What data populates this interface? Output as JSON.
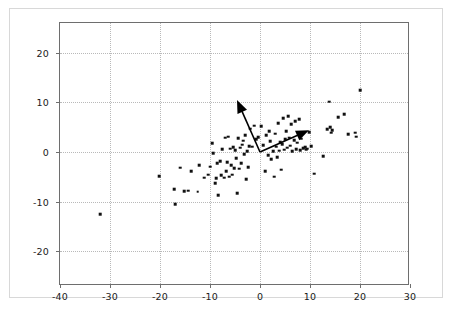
{
  "chart_data": {
    "type": "scatter",
    "title": "",
    "subtitle": "",
    "xlabel": "",
    "ylabel": "",
    "xlim": [
      -40,
      30
    ],
    "ylim": [
      -27,
      26
    ],
    "grid": true,
    "grid_style": "dotted",
    "legend": "none",
    "point_color": "#111111",
    "point_marker": "square",
    "point_size_px": 2.6,
    "xticks": [
      -40,
      -30,
      -20,
      -10,
      0,
      10,
      20,
      30
    ],
    "xtick_labels": [
      "-40",
      "-30",
      "-20",
      "-10",
      "0",
      "10",
      "20",
      "30"
    ],
    "yticks": [
      -20,
      -10,
      0,
      10,
      20
    ],
    "ytick_labels": [
      "-20",
      "-10",
      "0",
      "10",
      "20"
    ],
    "series": [
      {
        "name": "data",
        "points": [
          [
            -32.0,
            -12.5
          ],
          [
            -20.2,
            -4.9
          ],
          [
            -17.2,
            -7.5
          ],
          [
            -17.0,
            -10.5
          ],
          [
            -16.0,
            -3.2
          ],
          [
            -15.2,
            -7.9
          ],
          [
            -14.4,
            -7.8
          ],
          [
            -13.8,
            -3.9
          ],
          [
            -12.5,
            -8.0
          ],
          [
            -12.2,
            -2.6
          ],
          [
            -11.2,
            -5.2
          ],
          [
            -10.4,
            -4.6
          ],
          [
            -10.0,
            -3.0
          ],
          [
            -9.6,
            1.8
          ],
          [
            -9.4,
            -0.2
          ],
          [
            -9.0,
            -6.3
          ],
          [
            -8.8,
            -5.3
          ],
          [
            -8.6,
            -2.2
          ],
          [
            -8.4,
            -8.7
          ],
          [
            -8.0,
            -1.8
          ],
          [
            -7.8,
            -4.7
          ],
          [
            -7.6,
            0.6
          ],
          [
            -7.2,
            -5.2
          ],
          [
            -7.0,
            2.9
          ],
          [
            -6.8,
            -3.9
          ],
          [
            -6.6,
            -2.0
          ],
          [
            -6.4,
            3.1
          ],
          [
            -6.2,
            -5.0
          ],
          [
            -6.0,
            0.7
          ],
          [
            -5.8,
            -2.6
          ],
          [
            -5.6,
            -4.6
          ],
          [
            -5.4,
            1.0
          ],
          [
            -5.2,
            -3.3
          ],
          [
            -5.0,
            0.4
          ],
          [
            -4.8,
            -1.2
          ],
          [
            -4.6,
            -8.3
          ],
          [
            -4.4,
            2.8
          ],
          [
            -4.2,
            -3.4
          ],
          [
            -4.0,
            0.9
          ],
          [
            -3.8,
            -2.3
          ],
          [
            -3.6,
            1.5
          ],
          [
            -3.4,
            2.3
          ],
          [
            -3.2,
            -0.4
          ],
          [
            -3.0,
            3.4
          ],
          [
            -2.8,
            -5.5
          ],
          [
            -2.6,
            0.2
          ],
          [
            -2.4,
            -3.1
          ],
          [
            -2.2,
            1.2
          ],
          [
            -2.0,
            4.7
          ],
          [
            -1.6,
            1.1
          ],
          [
            -1.2,
            5.3
          ],
          [
            -0.8,
            2.6
          ],
          [
            -0.4,
            3.0
          ],
          [
            0.2,
            5.2
          ],
          [
            0.6,
            1.4
          ],
          [
            1.0,
            -3.9
          ],
          [
            1.2,
            3.4
          ],
          [
            1.6,
            -0.6
          ],
          [
            1.8,
            4.2
          ],
          [
            2.0,
            2.2
          ],
          [
            2.2,
            -1.4
          ],
          [
            2.6,
            0.2
          ],
          [
            2.8,
            -5.0
          ],
          [
            3.0,
            3.7
          ],
          [
            3.2,
            1.1
          ],
          [
            3.4,
            -1.1
          ],
          [
            3.6,
            5.8
          ],
          [
            3.8,
            0.3
          ],
          [
            4.0,
            2.0
          ],
          [
            4.2,
            -3.6
          ],
          [
            4.4,
            1.6
          ],
          [
            4.6,
            6.8
          ],
          [
            4.8,
            0.5
          ],
          [
            5.0,
            2.6
          ],
          [
            5.2,
            4.2
          ],
          [
            5.4,
            0.9
          ],
          [
            5.6,
            7.2
          ],
          [
            5.8,
            2.9
          ],
          [
            6.0,
            1.3
          ],
          [
            6.2,
            5.6
          ],
          [
            6.4,
            0.2
          ],
          [
            6.8,
            2.4
          ],
          [
            7.0,
            6.2
          ],
          [
            7.2,
            0.6
          ],
          [
            7.4,
            1.9
          ],
          [
            7.8,
            6.6
          ],
          [
            8.0,
            0.4
          ],
          [
            8.2,
            2.7
          ],
          [
            8.6,
            0.8
          ],
          [
            9.0,
            1.0
          ],
          [
            9.2,
            0.5
          ],
          [
            9.4,
            0.7
          ],
          [
            9.8,
            4.0
          ],
          [
            10.2,
            1.2
          ],
          [
            10.8,
            -4.4
          ],
          [
            12.6,
            -0.8
          ],
          [
            13.4,
            4.6
          ],
          [
            13.8,
            10.1
          ],
          [
            14.0,
            5.0
          ],
          [
            14.2,
            3.9
          ],
          [
            14.4,
            4.4
          ],
          [
            15.6,
            7.0
          ],
          [
            16.8,
            7.6
          ],
          [
            17.6,
            3.6
          ],
          [
            19.0,
            3.9
          ],
          [
            19.2,
            3.1
          ],
          [
            20.0,
            12.5
          ]
        ]
      }
    ],
    "vectors": [
      {
        "name": "principal-component-1",
        "origin": [
          0,
          0
        ],
        "tip": [
          9.8,
          4.4
        ],
        "color": "#000000"
      },
      {
        "name": "principal-component-2",
        "origin": [
          0,
          0
        ],
        "tip": [
          -4.6,
          10.5
        ],
        "color": "#000000"
      }
    ]
  }
}
